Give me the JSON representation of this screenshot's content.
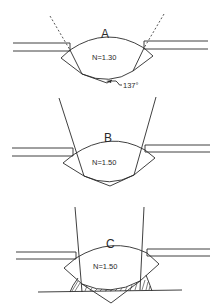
{
  "figure": {
    "panels": [
      {
        "id": "A",
        "label": "A",
        "index_label": "N=1.30",
        "angle_label": "137°",
        "ray_style": "dashed",
        "filled_bottom": false
      },
      {
        "id": "B",
        "label": "B",
        "index_label": "N=1.50",
        "ray_style": "solid",
        "filled_bottom": false
      },
      {
        "id": "C",
        "label": "C",
        "index_label": "N=1.50",
        "ray_style": "solid",
        "filled_bottom": true
      }
    ]
  }
}
